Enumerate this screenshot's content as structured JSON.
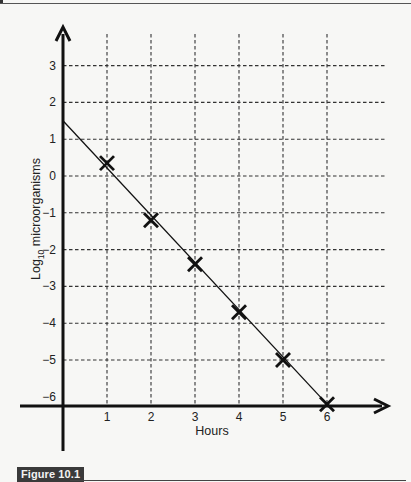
{
  "figure": {
    "label": "Figure 10.1",
    "colors": {
      "background": "#f7f7f5",
      "ink": "#111111",
      "grid": "#333333",
      "badge_bg": "#3a3a3a",
      "badge_text": "#f3f3f3"
    }
  },
  "chart_data": {
    "type": "line",
    "title": "",
    "xlabel": "Hours",
    "ylabel": "Log10 microorganisms",
    "ylabel_parts": {
      "base": "Log",
      "sub": "10",
      "rest": " microorganisms"
    },
    "x_ticks": [
      "1",
      "2",
      "3",
      "4",
      "5",
      "6"
    ],
    "y_ticks": [
      "3",
      "2",
      "1",
      "0",
      "−1",
      "−2",
      "−3",
      "−4",
      "−5",
      "−6"
    ],
    "xlim": [
      0,
      7
    ],
    "ylim": [
      -6.3,
      3.6
    ],
    "grid": true,
    "grid_style": "dashed",
    "series": [
      {
        "name": "Measured points",
        "marker": "x",
        "x": [
          1,
          2,
          3,
          4,
          5,
          6
        ],
        "y": [
          0.35,
          -1.2,
          -2.4,
          -3.7,
          -5.0,
          -6.2
        ]
      },
      {
        "name": "Best-fit line",
        "marker": "none",
        "x": [
          0,
          6
        ],
        "y": [
          1.5,
          -6.2
        ]
      }
    ],
    "annotations": []
  }
}
